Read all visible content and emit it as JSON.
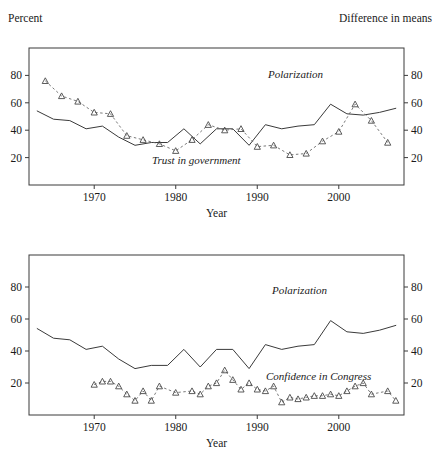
{
  "figure": {
    "running_head": "",
    "x_axis_title": "Year"
  },
  "panel_top": {
    "left_axis_title": "Percent",
    "right_axis_title": "Difference in means",
    "label_polarization": "Polarization",
    "label_trust": "Trust in government"
  },
  "panel_bottom": {
    "label_polarization": "Polarization",
    "label_confidence": "Confidence in Congress",
    "x_axis_title": "Year"
  },
  "chart_data": [
    {
      "type": "line",
      "panel": "top",
      "title": "",
      "xlabel": "Year",
      "ylabel": "Percent",
      "ylabel_right": "Difference in means",
      "xlim": [
        1962,
        2008
      ],
      "ylim": [
        0,
        100
      ],
      "yticks": [
        20,
        40,
        60,
        80
      ],
      "yticks_right": [
        20,
        40,
        60,
        80
      ],
      "xticks": [
        1970,
        1980,
        1990,
        2000
      ],
      "grid": false,
      "legend_position": "inline-annotations",
      "series": [
        {
          "name": "Polarization",
          "style": "solid-line",
          "color": "#3a3a3a",
          "x": [
            1963,
            1965,
            1967,
            1969,
            1971,
            1973,
            1975,
            1977,
            1979,
            1981,
            1983,
            1985,
            1987,
            1989,
            1991,
            1993,
            1995,
            1997,
            1999,
            2001,
            2003,
            2005,
            2007
          ],
          "values": [
            54,
            48,
            47,
            41,
            43,
            35,
            29,
            31,
            31,
            41,
            30,
            41,
            41,
            29,
            44,
            41,
            43,
            44,
            59,
            52,
            51,
            53,
            56
          ]
        },
        {
          "name": "Trust in government",
          "style": "dashed-line-triangles",
          "color": "#6a6a6a",
          "x": [
            1964,
            1966,
            1968,
            1970,
            1972,
            1974,
            1976,
            1978,
            1980,
            1982,
            1984,
            1986,
            1988,
            1990,
            1992,
            1994,
            1996,
            1998,
            2000,
            2002,
            2004,
            2006
          ],
          "values": [
            76,
            65,
            61,
            53,
            52,
            36,
            33,
            30,
            25,
            33,
            44,
            40,
            41,
            28,
            29,
            22,
            23,
            32,
            39,
            59,
            47,
            31
          ]
        }
      ]
    },
    {
      "type": "line",
      "panel": "bottom",
      "title": "",
      "xlabel": "Year",
      "ylabel": "",
      "xlim": [
        1962,
        2008
      ],
      "ylim": [
        0,
        100
      ],
      "yticks": [
        20,
        40,
        60,
        80
      ],
      "yticks_right": [
        20,
        40,
        60,
        80
      ],
      "xticks": [
        1970,
        1980,
        1990,
        2000
      ],
      "grid": false,
      "legend_position": "inline-annotations",
      "series": [
        {
          "name": "Polarization",
          "style": "solid-line",
          "color": "#3a3a3a",
          "x": [
            1963,
            1965,
            1967,
            1969,
            1971,
            1973,
            1975,
            1977,
            1979,
            1981,
            1983,
            1985,
            1987,
            1989,
            1991,
            1993,
            1995,
            1997,
            1999,
            2001,
            2003,
            2005,
            2007
          ],
          "values": [
            54,
            48,
            47,
            41,
            43,
            35,
            29,
            31,
            31,
            41,
            30,
            41,
            41,
            29,
            44,
            41,
            43,
            44,
            59,
            52,
            51,
            53,
            56
          ]
        },
        {
          "name": "Confidence in Congress",
          "style": "dashed-line-triangles",
          "color": "#6a6a6a",
          "x": [
            1970,
            1971,
            1972,
            1973,
            1974,
            1975,
            1976,
            1977,
            1978,
            1980,
            1982,
            1983,
            1984,
            1985,
            1986,
            1987,
            1988,
            1989,
            1990,
            1991,
            1992,
            1993,
            1994,
            1995,
            1996,
            1997,
            1998,
            1999,
            2000,
            2001,
            2002,
            2003,
            2004,
            2006,
            2007
          ],
          "values": [
            19,
            21,
            21,
            18,
            13,
            9,
            15,
            9,
            18,
            14,
            15,
            13,
            18,
            20,
            28,
            22,
            16,
            20,
            16,
            15,
            18,
            8,
            11,
            10,
            11,
            12,
            12,
            13,
            12,
            15,
            18,
            20,
            13,
            15,
            9
          ]
        }
      ]
    }
  ]
}
